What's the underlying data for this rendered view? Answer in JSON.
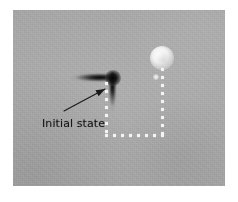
{
  "figure": {
    "type": "grayscale-micrograph",
    "width": 238,
    "height": 202,
    "page_background": "#ffffff",
    "plate": {
      "left": 13,
      "top": 10,
      "width": 212,
      "height": 176,
      "background_color": "#a9a9a9",
      "description": "noisy medium-gray imaging plate"
    }
  },
  "annotations": {
    "label": "Initial state",
    "label_color": "#141414",
    "arrow": {
      "tail_x": 51,
      "tail_y": 101,
      "tip_x": 92,
      "tip_y": 79,
      "color": "#1a1a1a"
    }
  },
  "features": {
    "cross": {
      "name": "dark-cross-feature",
      "color": "#111111",
      "junction_x": 99,
      "junction_y": 67,
      "horizontal_arm": {
        "left": 42,
        "top": 62,
        "width": 62,
        "height": 11
      },
      "vertical_arm": {
        "left": 94,
        "top": 62,
        "width": 11,
        "height": 58
      },
      "node": {
        "left": 92,
        "top": 60,
        "width": 16,
        "height": 16
      }
    },
    "bright_blob": {
      "name": "bright-blob-feature",
      "color": "#fcfcfc",
      "center_x": 149,
      "center_y": 48,
      "radius": 12
    },
    "bright_speck": {
      "name": "bright-speck-feature",
      "center_x": 143,
      "center_y": 67,
      "radius": 3
    }
  },
  "guide_lines": {
    "color": "#f4f4f4",
    "dot_size": 3,
    "left_vertical": {
      "name": "left-vertical-dotted-guide",
      "x": 92,
      "y_start": 72,
      "y_end": 124,
      "spacing": 8
    },
    "right_vertical": {
      "name": "right-vertical-dotted-guide",
      "x": 148,
      "y_start": 58,
      "y_end": 124,
      "spacing": 8
    },
    "bottom_horizontal": {
      "name": "bottom-horizontal-dotted-guide",
      "y": 124,
      "x_start": 92,
      "x_end": 150,
      "spacing": 8
    }
  }
}
